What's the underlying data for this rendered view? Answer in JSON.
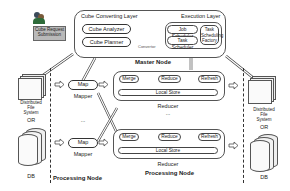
{
  "diagram": {
    "user_submission": {
      "label_line1": "Cube Request",
      "label_line2": "Submission"
    },
    "master_node": {
      "label": "Master Node",
      "cube_converting_layer": {
        "title": "Cube  Converting Layer",
        "components": [
          "Cube Analyzer",
          "Cube Planner"
        ]
      },
      "converter_label": "Convertor",
      "execution_layer": {
        "title": "Execution Layer",
        "components": [
          "Job Scheduler",
          "Task Scheduler"
        ],
        "factory": {
          "line1": "Task",
          "line2": "Scheduling",
          "line3": "Factory"
        }
      }
    },
    "left_storage": {
      "fs_label_line1": "Distributed",
      "fs_label_line2": "File",
      "fs_label_line3": "System",
      "or_label": "OR",
      "db_label": "DB"
    },
    "right_storage": {
      "fs_label_line1": "Distributed",
      "fs_label_line2": "File",
      "fs_label_line3": "System",
      "or_label": "OR",
      "db_label": "DB"
    },
    "mappers": [
      {
        "component": "Map",
        "label": "Mapper"
      },
      {
        "component": "Map",
        "label": "Mapper"
      }
    ],
    "mapper_ellipsis": "...",
    "reducers": [
      {
        "components": [
          "Merge",
          "Reduce",
          "Refresh"
        ],
        "store": "Local Store",
        "label": "Reducer"
      },
      {
        "components": [
          "Merge",
          "Reduce",
          "Refresh"
        ],
        "store": "Local Store",
        "label": "Reducer"
      }
    ],
    "reducer_ellipsis": "...",
    "processing_node_labels": [
      "Processing Node",
      "Processing Node"
    ]
  }
}
